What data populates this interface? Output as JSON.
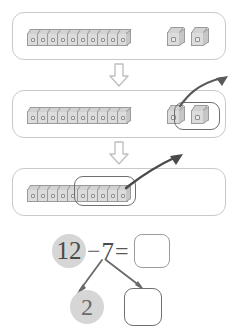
{
  "worksheet": {
    "title": "Subtraction with cubes: 12 minus 7",
    "ghost_text_top": "",
    "ghost_text_mid": ""
  },
  "panels": [
    {
      "id": "panel-1",
      "name": "initial-quantity-panel",
      "caption": "Start: one ten-stick and two loose cubes",
      "stick_cubes": 10,
      "loose_cubes": 2,
      "circled_count": 0,
      "has_takeaway_arrow": false
    },
    {
      "id": "panel-2",
      "name": "remove-ones-panel",
      "caption": "Take away the 2 loose cubes",
      "stick_cubes": 10,
      "loose_cubes": 2,
      "circled_count": 2,
      "has_takeaway_arrow": true
    },
    {
      "id": "panel-3",
      "name": "remove-from-ten-panel",
      "caption": "Take away 5 more from the ten-stick",
      "stick_cubes": 10,
      "loose_cubes": 0,
      "circled_count": 5,
      "has_takeaway_arrow": true
    }
  ],
  "flow_arrows": [
    {
      "name": "step-arrow-1",
      "direction": "down"
    },
    {
      "name": "step-arrow-2",
      "direction": "down"
    }
  ],
  "equation": {
    "minuend": "12",
    "minuend_highlighted": true,
    "operator": "−",
    "subtrahend": "7",
    "equals": "=",
    "answer": "",
    "answer_placeholder": ""
  },
  "number_bond": {
    "parent": "7",
    "left_part": "2",
    "left_part_highlighted": true,
    "right_part": "",
    "right_part_placeholder": ""
  },
  "colors": {
    "panel_border": "#c9c9c9",
    "cube_face": "#dcdcdc",
    "cube_outline": "#9a9a9a",
    "ring_outline": "#6f6f6f",
    "highlight_circle": "#d6d6d6",
    "text": "#4a4a4a",
    "arrow": "#5a5a5a",
    "background": "#ffffff"
  }
}
